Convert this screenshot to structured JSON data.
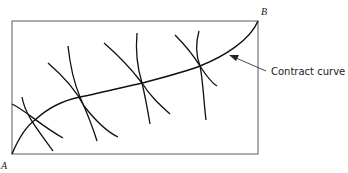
{
  "diagram": {
    "type": "edgeworth-box",
    "labels": {
      "origin_a": "A",
      "origin_b": "B",
      "contract_curve": "Contract curve"
    },
    "colors": {
      "line": "#111111",
      "box": "#777777",
      "background": "#ffffff"
    },
    "tangency_points": [
      {
        "x": 35,
        "y": 120
      },
      {
        "x": 80,
        "y": 97
      },
      {
        "x": 142,
        "y": 83
      },
      {
        "x": 200,
        "y": 66
      }
    ]
  }
}
